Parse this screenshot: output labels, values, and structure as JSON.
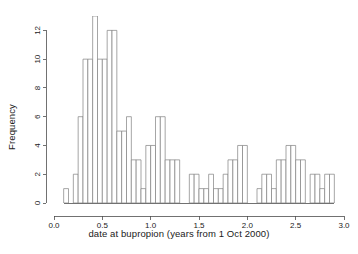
{
  "chart_data": {
    "type": "bar",
    "title": "",
    "subtitle": "",
    "xlabel": "date at bupropion (years from 1 Oct 2000)",
    "ylabel": "Frequency",
    "xlim": [
      0.0,
      3.0
    ],
    "ylim": [
      0,
      13
    ],
    "grid": false,
    "legend": null,
    "bin_width": 0.05,
    "bin_starts": [
      0.1,
      0.15,
      0.2,
      0.25,
      0.3,
      0.35,
      0.4,
      0.45,
      0.5,
      0.55,
      0.6,
      0.65,
      0.7,
      0.75,
      0.8,
      0.85,
      0.9,
      0.95,
      1.0,
      1.05,
      1.1,
      1.15,
      1.2,
      1.25,
      1.3,
      1.35,
      1.4,
      1.45,
      1.5,
      1.55,
      1.6,
      1.65,
      1.7,
      1.75,
      1.8,
      1.85,
      1.9,
      1.95,
      2.0,
      2.05,
      2.1,
      2.15,
      2.2,
      2.25,
      2.3,
      2.35,
      2.4,
      2.45,
      2.5,
      2.55,
      2.6,
      2.65,
      2.7,
      2.75,
      2.8,
      2.85
    ],
    "values": [
      1,
      2,
      2,
      6,
      10,
      10,
      13,
      13,
      10,
      10,
      12,
      12,
      5,
      5,
      6,
      6,
      3,
      3,
      1,
      4,
      4,
      6,
      6,
      3,
      3,
      0,
      0,
      2,
      2,
      1,
      1,
      2,
      2,
      1,
      1,
      3,
      3,
      4,
      4,
      0,
      1,
      1,
      2,
      2,
      1,
      1,
      3,
      3,
      4,
      4,
      3,
      3,
      0,
      2,
      2,
      1
    ],
    "bars": [
      {
        "x0": 0.1,
        "x1": 0.15,
        "y": 1
      },
      {
        "x0": 0.15,
        "x1": 0.2,
        "y": 0
      },
      {
        "x0": 0.2,
        "x1": 0.25,
        "y": 2
      },
      {
        "x0": 0.25,
        "x1": 0.3,
        "y": 6
      },
      {
        "x0": 0.3,
        "x1": 0.35,
        "y": 10
      },
      {
        "x0": 0.35,
        "x1": 0.4,
        "y": 10
      },
      {
        "x0": 0.4,
        "x1": 0.45,
        "y": 13
      },
      {
        "x0": 0.45,
        "x1": 0.5,
        "y": 10
      },
      {
        "x0": 0.5,
        "x1": 0.55,
        "y": 10
      },
      {
        "x0": 0.55,
        "x1": 0.6,
        "y": 12
      },
      {
        "x0": 0.6,
        "x1": 0.65,
        "y": 12
      },
      {
        "x0": 0.65,
        "x1": 0.7,
        "y": 5
      },
      {
        "x0": 0.7,
        "x1": 0.75,
        "y": 5
      },
      {
        "x0": 0.75,
        "x1": 0.8,
        "y": 6
      },
      {
        "x0": 0.8,
        "x1": 0.85,
        "y": 3
      },
      {
        "x0": 0.85,
        "x1": 0.9,
        "y": 3
      },
      {
        "x0": 0.9,
        "x1": 0.95,
        "y": 1
      },
      {
        "x0": 0.95,
        "x1": 1.0,
        "y": 4
      },
      {
        "x0": 1.0,
        "x1": 1.05,
        "y": 4
      },
      {
        "x0": 1.05,
        "x1": 1.1,
        "y": 6
      },
      {
        "x0": 1.1,
        "x1": 1.15,
        "y": 6
      },
      {
        "x0": 1.15,
        "x1": 1.2,
        "y": 3
      },
      {
        "x0": 1.2,
        "x1": 1.25,
        "y": 3
      },
      {
        "x0": 1.25,
        "x1": 1.3,
        "y": 3
      },
      {
        "x0": 1.3,
        "x1": 1.35,
        "y": 0
      },
      {
        "x0": 1.35,
        "x1": 1.4,
        "y": 0
      },
      {
        "x0": 1.4,
        "x1": 1.45,
        "y": 2
      },
      {
        "x0": 1.45,
        "x1": 1.5,
        "y": 2
      },
      {
        "x0": 1.5,
        "x1": 1.55,
        "y": 1
      },
      {
        "x0": 1.55,
        "x1": 1.6,
        "y": 1
      },
      {
        "x0": 1.6,
        "x1": 1.65,
        "y": 2
      },
      {
        "x0": 1.65,
        "x1": 1.7,
        "y": 1
      },
      {
        "x0": 1.7,
        "x1": 1.75,
        "y": 1
      },
      {
        "x0": 1.75,
        "x1": 1.8,
        "y": 2
      },
      {
        "x0": 1.8,
        "x1": 1.85,
        "y": 3
      },
      {
        "x0": 1.85,
        "x1": 1.9,
        "y": 3
      },
      {
        "x0": 1.9,
        "x1": 1.95,
        "y": 4
      },
      {
        "x0": 1.95,
        "x1": 2.0,
        "y": 4
      },
      {
        "x0": 2.0,
        "x1": 2.05,
        "y": 0
      },
      {
        "x0": 2.05,
        "x1": 2.1,
        "y": 0
      },
      {
        "x0": 2.1,
        "x1": 2.15,
        "y": 1
      },
      {
        "x0": 2.15,
        "x1": 2.2,
        "y": 2
      },
      {
        "x0": 2.2,
        "x1": 2.25,
        "y": 2
      },
      {
        "x0": 2.25,
        "x1": 2.3,
        "y": 1
      },
      {
        "x0": 2.3,
        "x1": 2.35,
        "y": 3
      },
      {
        "x0": 2.35,
        "x1": 2.4,
        "y": 3
      },
      {
        "x0": 2.4,
        "x1": 2.45,
        "y": 4
      },
      {
        "x0": 2.45,
        "x1": 2.5,
        "y": 4
      },
      {
        "x0": 2.5,
        "x1": 2.55,
        "y": 3
      },
      {
        "x0": 2.55,
        "x1": 2.6,
        "y": 3
      },
      {
        "x0": 2.6,
        "x1": 2.65,
        "y": 0
      },
      {
        "x0": 2.65,
        "x1": 2.7,
        "y": 2
      },
      {
        "x0": 2.7,
        "x1": 2.75,
        "y": 2
      },
      {
        "x0": 2.75,
        "x1": 2.8,
        "y": 1
      },
      {
        "x0": 2.8,
        "x1": 2.85,
        "y": 2
      },
      {
        "x0": 2.85,
        "x1": 2.9,
        "y": 2
      }
    ],
    "x_ticks": [
      {
        "value": 0.0,
        "label": "0.0"
      },
      {
        "value": 0.5,
        "label": "0.5"
      },
      {
        "value": 1.0,
        "label": "1.0"
      },
      {
        "value": 1.5,
        "label": "1.5"
      },
      {
        "value": 2.0,
        "label": "2.0"
      },
      {
        "value": 2.5,
        "label": "2.5"
      },
      {
        "value": 3.0,
        "label": "3.0"
      }
    ],
    "y_ticks": [
      {
        "value": 0,
        "label": "0"
      },
      {
        "value": 2,
        "label": "2"
      },
      {
        "value": 4,
        "label": "4"
      },
      {
        "value": 6,
        "label": "6"
      },
      {
        "value": 8,
        "label": "8"
      },
      {
        "value": 10,
        "label": "10"
      },
      {
        "value": 12,
        "label": "12"
      }
    ],
    "colors": {
      "background": "#ffffff",
      "bar_fill": "#ffffff",
      "bar_stroke": "#808080",
      "axis": "#4d4d4d",
      "text": "#1a1a1a"
    }
  }
}
